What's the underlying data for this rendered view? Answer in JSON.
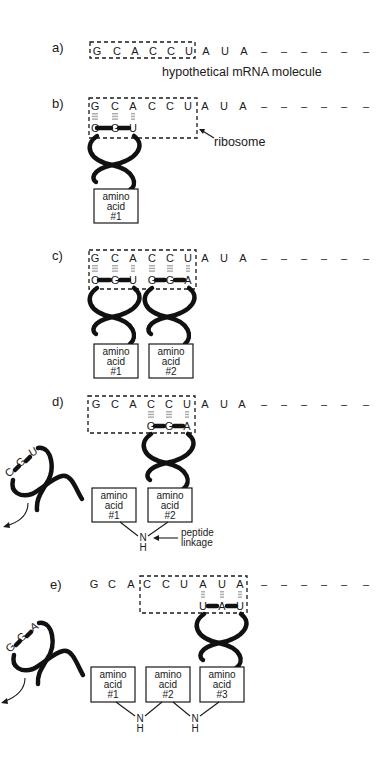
{
  "panels": {
    "a": {
      "label": "a)",
      "mrna": [
        "G",
        "C",
        "A",
        "C",
        "C",
        "U",
        "A",
        "U",
        "A",
        "–",
        "–",
        "–",
        "–",
        "–",
        "–"
      ],
      "caption": "hypothetical mRNA molecule"
    },
    "b": {
      "label": "b)",
      "mrna": [
        "G",
        "C",
        "A",
        "C",
        "C",
        "U",
        "A",
        "U",
        "A",
        "–",
        "–",
        "–",
        "–",
        "–",
        "–"
      ],
      "anticodon1": [
        "C",
        "G",
        "U"
      ],
      "ribosome_label": "ribosome",
      "aa1": [
        "amino",
        "acid",
        "#1"
      ]
    },
    "c": {
      "label": "c)",
      "mrna": [
        "G",
        "C",
        "A",
        "C",
        "C",
        "U",
        "A",
        "U",
        "A",
        "–",
        "–",
        "–",
        "–",
        "–",
        "–"
      ],
      "anticodon1": [
        "C",
        "G",
        "U"
      ],
      "anticodon2": [
        "G",
        "G",
        "A"
      ],
      "aa1": [
        "amino",
        "acid",
        "#1"
      ],
      "aa2": [
        "amino",
        "acid",
        "#2"
      ]
    },
    "d": {
      "label": "d)",
      "mrna": [
        "G",
        "C",
        "A",
        "C",
        "C",
        "U",
        "A",
        "U",
        "A",
        "–",
        "–",
        "–",
        "–",
        "–",
        "–"
      ],
      "released_anticodon": [
        "C",
        "G",
        "U"
      ],
      "anticodon2": [
        "G",
        "G",
        "A"
      ],
      "aa1": [
        "amino",
        "acid",
        "#1"
      ],
      "aa2": [
        "amino",
        "acid",
        "#2"
      ],
      "linkage_n": "N",
      "linkage_h": "H",
      "peptide_label": [
        "peptide",
        "linkage"
      ]
    },
    "e": {
      "label": "e)",
      "mrna": [
        "G",
        "C",
        "A",
        "C",
        "C",
        "U",
        "A",
        "U",
        "A",
        "–",
        "–",
        "–",
        "–",
        "–",
        "–"
      ],
      "released_anticodon": [
        "G",
        "G",
        "A"
      ],
      "anticodon3": [
        "U",
        "A",
        "U"
      ],
      "aa1": [
        "amino",
        "acid",
        "#1"
      ],
      "aa2": [
        "amino",
        "acid",
        "#2"
      ],
      "aa3": [
        "amino",
        "acid",
        "#3"
      ],
      "linkage_n": "N",
      "linkage_h": "H"
    }
  }
}
